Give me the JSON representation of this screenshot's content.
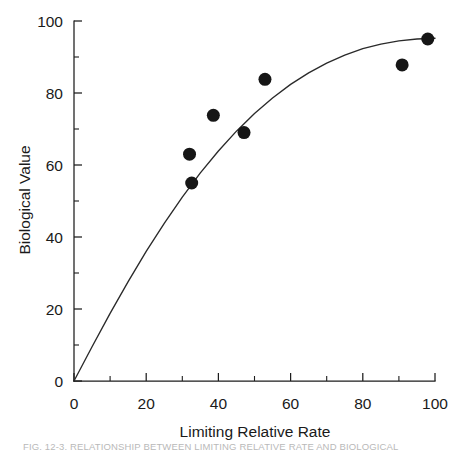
{
  "figure": {
    "background_color": "#ffffff",
    "ink_color": "#1a1a1a",
    "caption_partial": "FIG. 12-3.   RELATIONSHIP BETWEEN LIMITING RELATIVE RATE AND BIOLOGICAL"
  },
  "chart_data": {
    "type": "scatter",
    "title": "",
    "subtitle": "",
    "xlabel": "Limiting Relative Rate",
    "ylabel": "Biological Value",
    "xlim": [
      0,
      100
    ],
    "ylim": [
      0,
      100
    ],
    "xticks": [
      0,
      20,
      40,
      60,
      80,
      100
    ],
    "yticks": [
      0,
      20,
      40,
      60,
      80,
      100
    ],
    "xticklabels": [
      "0",
      "20",
      "40",
      "60",
      "80",
      "100"
    ],
    "yticklabels": [
      "0",
      "20",
      "40",
      "60",
      "80",
      "100"
    ],
    "x_minor_ticks": [
      10,
      30,
      50,
      70,
      90
    ],
    "y_minor_ticks": [
      10,
      30,
      50,
      70,
      90
    ],
    "grid": false,
    "legend": null,
    "marker": "filled-circle",
    "marker_color": "#161616",
    "marker_size_px": 13,
    "points": [
      {
        "x": 32.0,
        "y": 63.0
      },
      {
        "x": 32.6,
        "y": 55.0
      },
      {
        "x": 38.6,
        "y": 73.8
      },
      {
        "x": 47.1,
        "y": 69.0
      },
      {
        "x": 52.9,
        "y": 83.8
      },
      {
        "x": 90.9,
        "y": 87.8
      },
      {
        "x": 98.0,
        "y": 95.0
      }
    ],
    "series": [
      {
        "name": "observations",
        "type": "scatter",
        "x": [
          32.0,
          32.6,
          38.6,
          47.1,
          52.9,
          90.9,
          98.0
        ],
        "values": [
          63.0,
          55.0,
          73.8,
          69.0,
          83.8,
          87.8,
          95.0
        ]
      },
      {
        "name": "fitted-curve",
        "type": "line",
        "color": "#2a2a2a",
        "description": "saturating curve through origin plateauing near 95",
        "x": [
          0,
          5,
          10,
          15,
          20,
          25,
          30,
          35,
          40,
          45,
          50,
          55,
          60,
          65,
          70,
          75,
          80,
          85,
          90,
          95,
          100
        ],
        "values": [
          0,
          9.5,
          18.8,
          27.6,
          36.0,
          43.8,
          51.1,
          57.8,
          63.9,
          69.4,
          74.3,
          78.6,
          82.4,
          85.6,
          88.3,
          90.5,
          92.3,
          93.6,
          94.5,
          95.0,
          95.2
        ]
      }
    ]
  },
  "axes": {
    "x_title": "Limiting Relative Rate",
    "y_title": "Biological Value",
    "tick_direction": "in",
    "spines": [
      "left",
      "bottom"
    ]
  }
}
